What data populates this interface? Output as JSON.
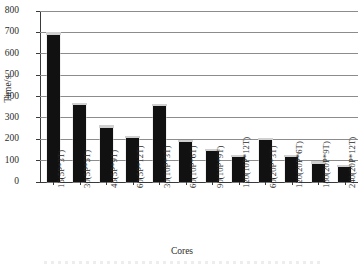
{
  "chart_data": {
    "type": "bar",
    "title": "",
    "xlabel": "Cores",
    "ylabel": "Time/s",
    "ylim": [
      0,
      800
    ],
    "ytick_step": 100,
    "yticks": [
      "800",
      "700",
      "600",
      "500",
      "400",
      "300",
      "200",
      "100",
      "0"
    ],
    "grid": true,
    "legend": "none",
    "bar_color": "#111111",
    "gridline_color": "#8c8c8c",
    "axis_color": "#3a3a3a",
    "categories": [
      "15(5P*3T)",
      "30(5P*5T)",
      "45(5P*9T)",
      "60(5P*12T)",
      "30(10P*3T)",
      "60(10P*6T)",
      "90(10P*9T)",
      "120(10P*12T)",
      "60(20P*3T)",
      "120(20P*6T)",
      "180(20P*9T)",
      "240(20P*12T)"
    ],
    "values": [
      690,
      360,
      255,
      205,
      355,
      185,
      145,
      115,
      195,
      115,
      85,
      70
    ]
  }
}
